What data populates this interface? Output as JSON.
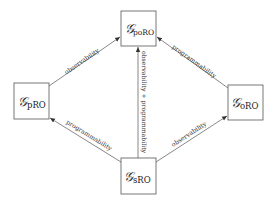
{
  "diagram": {
    "nodes": [
      {
        "id": "poRO",
        "symbol": "𝒢",
        "subscript": "poRO",
        "x": 121,
        "y": 11,
        "w": 35,
        "h": 35
      },
      {
        "id": "pRO",
        "symbol": "𝒢",
        "subscript": "pRO",
        "x": 14,
        "y": 83,
        "w": 35,
        "h": 36
      },
      {
        "id": "oRO",
        "symbol": "𝒢",
        "subscript": "oRO",
        "x": 228,
        "y": 85,
        "w": 35,
        "h": 35
      },
      {
        "id": "sRO",
        "symbol": "𝒢",
        "subscript": "sRO",
        "x": 121,
        "y": 158,
        "w": 35,
        "h": 36
      }
    ],
    "edges": [
      {
        "from": "pRO",
        "to": "poRO",
        "label": "observability"
      },
      {
        "from": "oRO",
        "to": "poRO",
        "label": "programmability"
      },
      {
        "from": "sRO",
        "to": "poRO",
        "label": "observability + programmability"
      },
      {
        "from": "sRO",
        "to": "pRO",
        "label": "programmability"
      },
      {
        "from": "sRO",
        "to": "oRO",
        "label": "observability"
      }
    ],
    "colors": {
      "stroke": "#555555",
      "text": "#222222"
    }
  }
}
